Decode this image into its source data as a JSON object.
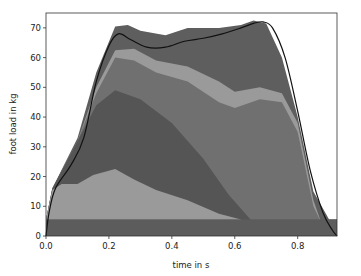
{
  "chart_data": {
    "type": "area",
    "title": "",
    "xlabel": "time in s",
    "ylabel": "foot load in kg",
    "xlim": [
      0.0,
      0.925
    ],
    "ylim": [
      0,
      75
    ],
    "xticks": [
      0.0,
      0.2,
      0.4,
      0.6,
      0.8
    ],
    "xtick_labels": [
      "0.0",
      "0.2",
      "0.4",
      "0.6",
      "0.8"
    ],
    "yticks": [
      0,
      10,
      20,
      30,
      40,
      50,
      60,
      70
    ],
    "ytick_labels": [
      "0",
      "10",
      "20",
      "30",
      "40",
      "50",
      "60",
      "70"
    ],
    "grid": false,
    "legend": null,
    "stacked": true,
    "colors": {
      "layer_base": "#5c5c5c",
      "layer_light_low": "#9a9a9a",
      "layer_dark_mid": "#555555",
      "layer_mid": "#707070",
      "layer_light_band": "#9a9a9a",
      "layer_top": "#5e5e5e",
      "total_line": "#111111",
      "axes": "#333333"
    },
    "series": [
      {
        "name": "layer 1 (base band)",
        "x": [
          0.0,
          0.02,
          0.9,
          0.925
        ],
        "upper": [
          5.5,
          5.5,
          5.5,
          5.5
        ]
      },
      {
        "name": "layer 2 (light low region)",
        "x": [
          0.0,
          0.02,
          0.05,
          0.1,
          0.15,
          0.22,
          0.28,
          0.35,
          0.45,
          0.55,
          0.62
        ],
        "upper": [
          5.5,
          15.5,
          17.5,
          17.5,
          20.5,
          22.5,
          19.0,
          15.5,
          12.0,
          7.5,
          5.5
        ]
      },
      {
        "name": "layer 3 (dark mid region)",
        "x": [
          0.0,
          0.02,
          0.1,
          0.16,
          0.22,
          0.3,
          0.4,
          0.5,
          0.58,
          0.65
        ],
        "upper": [
          5.5,
          16.0,
          32.0,
          44.0,
          49.0,
          46.0,
          38.0,
          26.0,
          14.0,
          5.5
        ]
      },
      {
        "name": "layer 4 (mid gray region)",
        "x": [
          0.0,
          0.02,
          0.1,
          0.16,
          0.22,
          0.28,
          0.35,
          0.45,
          0.55,
          0.6,
          0.68,
          0.75,
          0.8,
          0.85,
          0.87
        ],
        "upper": [
          5.5,
          16.0,
          32.0,
          48.0,
          60.0,
          59.0,
          55.0,
          52.0,
          45.0,
          43.0,
          46.0,
          45.0,
          35.0,
          10.0,
          5.5
        ]
      },
      {
        "name": "layer 5 (light band)",
        "x": [
          0.0,
          0.02,
          0.1,
          0.16,
          0.22,
          0.28,
          0.35,
          0.45,
          0.55,
          0.6,
          0.68,
          0.75,
          0.8,
          0.85,
          0.87
        ],
        "upper": [
          5.5,
          16.0,
          32.0,
          50.0,
          62.5,
          63.0,
          59.0,
          57.0,
          52.0,
          48.5,
          50.0,
          48.0,
          38.0,
          12.0,
          6.0
        ]
      },
      {
        "name": "layer 6 (top dark region)",
        "x": [
          0.0,
          0.02,
          0.1,
          0.16,
          0.22,
          0.26,
          0.3,
          0.38,
          0.45,
          0.55,
          0.62,
          0.66,
          0.7,
          0.75,
          0.8,
          0.85,
          0.9,
          0.925
        ],
        "upper": [
          0.0,
          16.0,
          33.0,
          55.0,
          70.5,
          71.0,
          69.0,
          67.5,
          70.0,
          70.0,
          71.0,
          72.5,
          71.5,
          60.0,
          40.0,
          15.0,
          5.5,
          5.5
        ]
      },
      {
        "name": "total (black line)",
        "x": [
          0.0,
          0.01,
          0.03,
          0.08,
          0.12,
          0.16,
          0.2,
          0.23,
          0.27,
          0.32,
          0.38,
          0.44,
          0.5,
          0.56,
          0.62,
          0.66,
          0.69,
          0.72,
          0.76,
          0.8,
          0.84,
          0.88,
          0.91,
          0.925
        ],
        "y": [
          0.0,
          8.0,
          16.0,
          24.0,
          33.0,
          52.0,
          64.0,
          68.0,
          66.0,
          63.5,
          63.5,
          65.5,
          66.5,
          68.0,
          70.0,
          71.5,
          72.0,
          70.0,
          60.0,
          42.0,
          22.0,
          8.0,
          2.0,
          0.0
        ]
      }
    ]
  },
  "plot": {
    "px_left": 46,
    "px_right": 337,
    "py_top": 13,
    "py_bottom": 236
  }
}
